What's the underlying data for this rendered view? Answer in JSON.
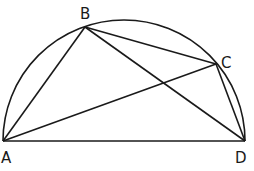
{
  "diagram": {
    "type": "geometry",
    "stroke_color": "#1a1a1a",
    "points": {
      "A": {
        "label": "A",
        "x": 3,
        "y": 141
      },
      "B": {
        "label": "B",
        "x": 85,
        "y": 27
      },
      "C": {
        "label": "C",
        "x": 216,
        "y": 64
      },
      "D": {
        "label": "D",
        "x": 245,
        "y": 141
      }
    },
    "segments": [
      "AB",
      "BC",
      "CD",
      "AD",
      "AC",
      "BD"
    ],
    "arc": {
      "from": "A",
      "to": "D",
      "type": "semicircle"
    }
  }
}
